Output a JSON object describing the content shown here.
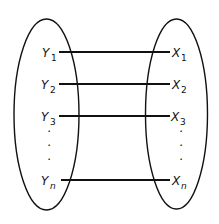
{
  "diagram": {
    "type": "mapping",
    "left_set": {
      "elements": [
        {
          "base": "Y",
          "sub": "1"
        },
        {
          "base": "Y",
          "sub": "2"
        },
        {
          "base": "Y",
          "sub": "3"
        },
        {
          "base": "Y",
          "sub": "n"
        }
      ],
      "ellipsis": "·"
    },
    "right_set": {
      "elements": [
        {
          "base": "X",
          "sub": "1"
        },
        {
          "base": "X",
          "sub": "2"
        },
        {
          "base": "X",
          "sub": "3"
        },
        {
          "base": "X",
          "sub": "n"
        }
      ],
      "ellipsis": "·"
    },
    "connections": [
      {
        "from": "Y1",
        "to": "X1"
      },
      {
        "from": "Y2",
        "to": "X2"
      },
      {
        "from": "Y3",
        "to": "X3"
      },
      {
        "from": "Yn",
        "to": "Xn"
      }
    ],
    "colors": {
      "stroke": "#111111",
      "background": "#ffffff"
    }
  }
}
